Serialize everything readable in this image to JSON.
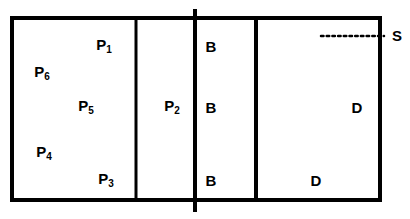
{
  "diagram": {
    "colors": {
      "line": "#000000",
      "background": "#ffffff"
    },
    "outer_box": {
      "x": 12,
      "y": 18,
      "width": 368,
      "height": 182,
      "stroke_width": 4
    },
    "dividers": [
      {
        "name": "divider-1",
        "x": 136,
        "y1": 18,
        "y2": 200,
        "stroke_width": 3
      },
      {
        "name": "divider-2",
        "x": 256,
        "y1": 18,
        "y2": 200,
        "stroke_width": 4
      }
    ],
    "center_line": {
      "x": 195,
      "y1": 9,
      "y2": 212,
      "stroke_width": 4
    },
    "dotted_line": {
      "x1": 321,
      "x2": 384,
      "y": 36
    },
    "labels": [
      {
        "id": "p1",
        "base": "P",
        "sub": "1",
        "x": 104,
        "y": 46
      },
      {
        "id": "p6",
        "base": "P",
        "sub": "6",
        "x": 42,
        "y": 73
      },
      {
        "id": "p5",
        "base": "P",
        "sub": "5",
        "x": 86,
        "y": 107
      },
      {
        "id": "p2",
        "base": "P",
        "sub": "2",
        "x": 172,
        "y": 107
      },
      {
        "id": "p4",
        "base": "P",
        "sub": "4",
        "x": 44,
        "y": 153
      },
      {
        "id": "p3",
        "base": "P",
        "sub": "3",
        "x": 106,
        "y": 180
      },
      {
        "id": "b-top",
        "base": "B",
        "sub": "",
        "x": 211,
        "y": 46
      },
      {
        "id": "b-mid",
        "base": "B",
        "sub": "",
        "x": 211,
        "y": 107
      },
      {
        "id": "b-bot",
        "base": "B",
        "sub": "",
        "x": 211,
        "y": 180
      },
      {
        "id": "d-mid",
        "base": "D",
        "sub": "",
        "x": 357,
        "y": 107
      },
      {
        "id": "d-bot",
        "base": "D",
        "sub": "",
        "x": 316,
        "y": 180
      },
      {
        "id": "s",
        "base": "S",
        "sub": "",
        "x": 397,
        "y": 35
      }
    ]
  }
}
